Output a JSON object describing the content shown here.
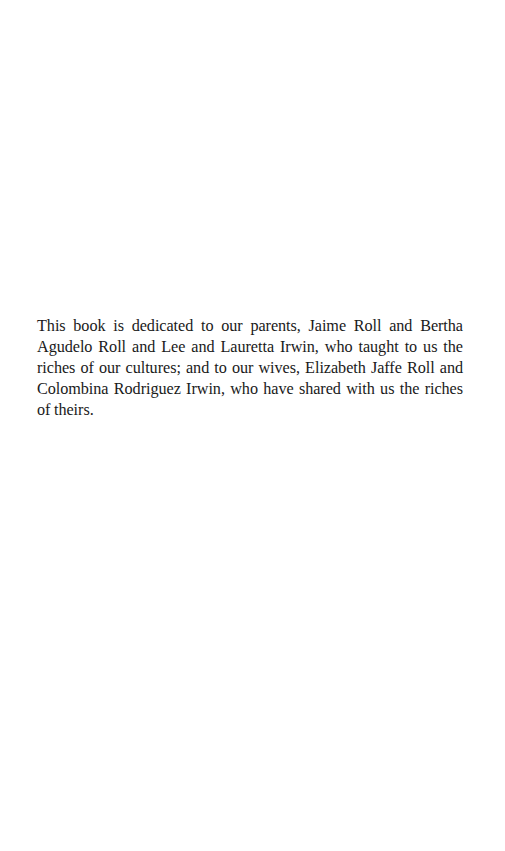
{
  "page": {
    "type": "dedication",
    "dedication": {
      "text": "This book is dedicated to our parents, Jaime Roll and Bertha Agudelo Roll and Lee and Lauretta Irwin, who taught to us the riches of our cultures; and to our wives, Elizabeth Jaffe Roll and Colombina Rodriguez Irwin, who have shared with us the riches of theirs."
    }
  }
}
